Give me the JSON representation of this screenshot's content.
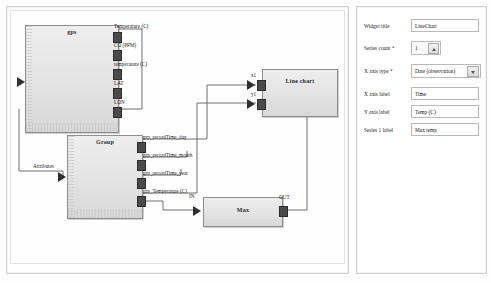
{
  "canvas": {
    "nodes": [
      {
        "id": "gps",
        "title": "gps",
        "outputs": [
          "Temperature (C)",
          "CO (PPM)",
          "temperature (C)",
          "LAT",
          "LON"
        ],
        "inputs": []
      },
      {
        "id": "group",
        "title": "Group",
        "input_label": "Attributes",
        "outputs": [
          "grp_recordTime_day",
          "grp_recordTime_month",
          "grp_recordTime_year",
          "grp_Temperature (C)"
        ]
      },
      {
        "id": "max",
        "title": "Max",
        "input_label": "IN",
        "output_label": "OUT"
      },
      {
        "id": "linechart",
        "title": "Line chart",
        "inputs": [
          "x1",
          "y1"
        ]
      }
    ]
  },
  "form": {
    "rows": [
      {
        "label": "Widget title",
        "type": "text",
        "value": "LineChart"
      },
      {
        "label": "Series count *",
        "type": "spinner",
        "value": "1"
      },
      {
        "label": "X axis type *",
        "type": "select",
        "value": "Date (observation)"
      },
      {
        "label": "X axis label",
        "type": "text",
        "value": "Time"
      },
      {
        "label": "Y axis label",
        "type": "text",
        "value": "Temp (C)"
      },
      {
        "label": "Series 1 label",
        "type": "text",
        "value": "Max temp"
      }
    ]
  }
}
